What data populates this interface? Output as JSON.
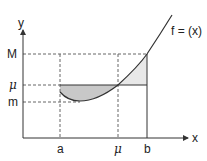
{
  "diagram": {
    "axes": {
      "x_label": "x",
      "y_label": "y"
    },
    "x_ticks": [
      {
        "label": "a",
        "x": 60
      },
      {
        "label": "μ",
        "x": 118
      },
      {
        "label": "b",
        "x": 147
      }
    ],
    "y_ticks": [
      {
        "label": "M",
        "y": 54
      },
      {
        "label": "μ",
        "y": 85
      },
      {
        "label": "m",
        "y": 102
      }
    ],
    "curve_label": "f = (x)",
    "colors": {
      "stroke": "#333333",
      "dashed": "#666666",
      "shade_dark": "#c8c8c8",
      "shade_light": "#e8e8e8"
    }
  }
}
